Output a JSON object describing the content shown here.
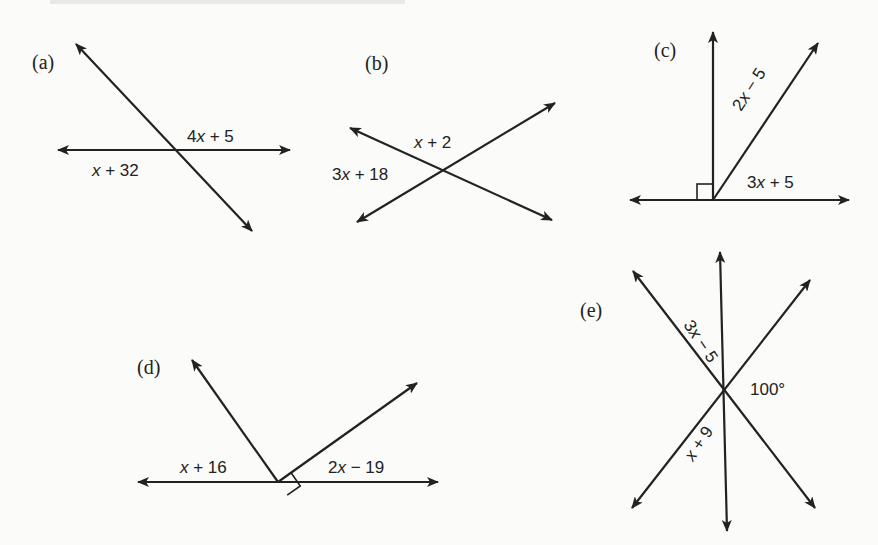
{
  "figure": {
    "panels": [
      {
        "id": "a",
        "label": "(a)",
        "label_pos": [
          32,
          69
        ],
        "lines": [
          {
            "name": "transversal-line",
            "x1": 76,
            "y1": 44,
            "x2": 252,
            "y2": 231,
            "arrows": "both"
          },
          {
            "name": "horizontal-line",
            "x1": 58,
            "y1": 150,
            "x2": 290,
            "y2": 150,
            "arrows": "both"
          }
        ],
        "angle_labels": [
          {
            "name": "angle-label-upper-right",
            "text": "4x + 5",
            "x": 187,
            "y": 142,
            "rotate": 0
          },
          {
            "name": "angle-label-lower-left",
            "text": "x + 32",
            "x": 92,
            "y": 176,
            "rotate": 0
          }
        ]
      },
      {
        "id": "b",
        "label": "(b)",
        "label_pos": [
          365,
          70
        ],
        "lines": [
          {
            "name": "line-descending",
            "x1": 350,
            "y1": 128,
            "x2": 552,
            "y2": 220,
            "arrows": "both"
          },
          {
            "name": "line-ascending",
            "x1": 357,
            "y1": 222,
            "x2": 555,
            "y2": 103,
            "arrows": "both"
          }
        ],
        "angle_labels": [
          {
            "name": "angle-label-top",
            "text": "x + 2",
            "x": 414,
            "y": 148,
            "rotate": 0
          },
          {
            "name": "angle-label-left",
            "text": "3x + 18",
            "x": 332,
            "y": 180,
            "rotate": 0
          }
        ]
      },
      {
        "id": "c",
        "label": "(c)",
        "label_pos": [
          654,
          57
        ],
        "lines": [
          {
            "name": "vertical-ray",
            "x1": 713,
            "y1": 200,
            "x2": 713,
            "y2": 32,
            "arrows": "end"
          },
          {
            "name": "slanted-ray",
            "x1": 713,
            "y1": 200,
            "x2": 818,
            "y2": 43,
            "arrows": "end"
          },
          {
            "name": "horizontal-line",
            "x1": 630,
            "y1": 200,
            "x2": 849,
            "y2": 200,
            "arrows": "both"
          }
        ],
        "right_angle_box": {
          "x": 697,
          "y": 184,
          "size": 16,
          "rotate": 0
        },
        "angle_labels": [
          {
            "name": "angle-label-between-rays",
            "text": "2x − 5",
            "x": 741,
            "y": 112,
            "rotate": -57
          },
          {
            "name": "angle-label-lower-right",
            "text": "3x + 5",
            "x": 747,
            "y": 188,
            "rotate": 0
          }
        ]
      },
      {
        "id": "d",
        "label": "(d)",
        "label_pos": [
          137,
          374
        ],
        "lines": [
          {
            "name": "left-ray",
            "x1": 278,
            "y1": 482,
            "x2": 192,
            "y2": 360,
            "arrows": "end"
          },
          {
            "name": "right-ray",
            "x1": 278,
            "y1": 482,
            "x2": 417,
            "y2": 383,
            "arrows": "end"
          },
          {
            "name": "horizontal-line",
            "x1": 138,
            "y1": 482,
            "x2": 438,
            "y2": 482,
            "arrows": "both"
          }
        ],
        "right_angle_box": {
          "x": 278,
          "y": 482,
          "size": 16,
          "rotate": -35
        },
        "angle_labels": [
          {
            "name": "angle-label-left",
            "text": "x + 16",
            "x": 180,
            "y": 473,
            "rotate": 0
          },
          {
            "name": "angle-label-right",
            "text": "2x − 19",
            "x": 328,
            "y": 473,
            "rotate": 0
          }
        ]
      },
      {
        "id": "e",
        "label": "(e)",
        "label_pos": [
          580,
          317
        ],
        "lines": [
          {
            "name": "vertical-line",
            "x1": 720,
            "y1": 252,
            "x2": 727,
            "y2": 531,
            "arrows": "both"
          },
          {
            "name": "diagonal-down-right",
            "x1": 633,
            "y1": 271,
            "x2": 815,
            "y2": 508,
            "arrows": "both"
          },
          {
            "name": "diagonal-up-right",
            "x1": 810,
            "y1": 280,
            "x2": 632,
            "y2": 508,
            "arrows": "both"
          }
        ],
        "angle_labels": [
          {
            "name": "angle-label-upper-left",
            "text": "3x − 5",
            "x": 683,
            "y": 325,
            "rotate": 56
          },
          {
            "name": "angle-label-right",
            "text": "100°",
            "x": 750,
            "y": 395,
            "rotate": 0
          },
          {
            "name": "angle-label-lower-left",
            "text": "x + 9",
            "x": 693,
            "y": 462,
            "rotate": -56
          }
        ]
      }
    ]
  }
}
